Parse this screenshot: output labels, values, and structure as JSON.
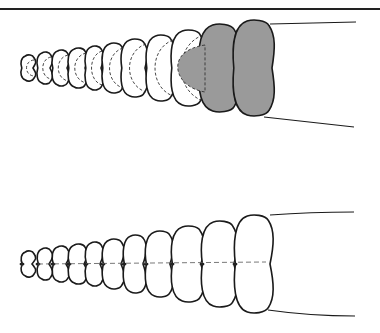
{
  "figure": {
    "panels": [
      {
        "id": "top",
        "view": "lateral, showing internal nested segments (dashed) with the two newest segments shaded",
        "segment_count": 11,
        "shaded_segments": 2,
        "shaded_color": "#9a9a9a"
      },
      {
        "id": "bottom",
        "view": "external view of rattle segments with central groove",
        "segment_count": 11,
        "shaded_segments": 0
      }
    ],
    "line_color": "#1a1a1a",
    "background": "#ffffff"
  }
}
